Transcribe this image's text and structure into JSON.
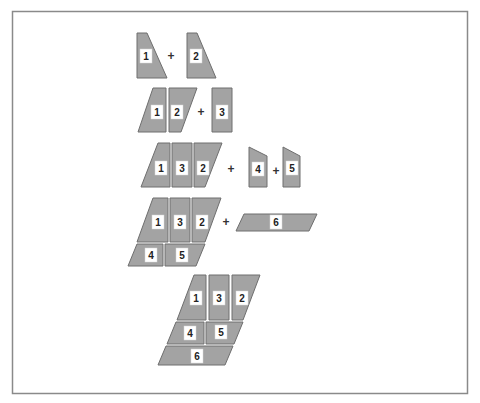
{
  "diagram": {
    "caption_cutoff": "",
    "colors": {
      "piece_fill": "#a3a3a3",
      "piece_stroke": "#6e6e6e",
      "label_bg": "#ffffff",
      "frame": "#8a8a8a"
    },
    "steps": [
      {
        "step": 1,
        "pieces": [
          {
            "label": "1",
            "points": "137,33 147,33 167,78 137,78",
            "lx": 146,
            "ly": 56
          },
          {
            "label": "2",
            "points": "187,33 197,33 216,78 187,78",
            "lx": 196,
            "ly": 56
          }
        ],
        "operators": [
          {
            "symbol": "+",
            "x": 171,
            "y": 56
          }
        ]
      },
      {
        "step": 2,
        "pieces": [
          {
            "label": "1",
            "points": "138,132 153,88 166,88 166,132",
            "lx": 157,
            "ly": 112
          },
          {
            "label": "2",
            "points": "169,88 197,88 181,132 169,132",
            "lx": 177,
            "ly": 112
          },
          {
            "label": "3",
            "points": "212,88 232,88 232,132 212,132",
            "lx": 222,
            "ly": 112
          }
        ],
        "operators": [
          {
            "symbol": "+",
            "x": 201,
            "y": 112
          }
        ]
      },
      {
        "step": 3,
        "pieces": [
          {
            "label": "1",
            "points": "141,187 158,143 170,143 170,187",
            "lx": 161,
            "ly": 168
          },
          {
            "label": "3",
            "points": "172,143 192,143 192,187 172,187",
            "lx": 182,
            "ly": 168
          },
          {
            "label": "2",
            "points": "194,143 222,143 205,187 194,187",
            "lx": 203,
            "ly": 168
          },
          {
            "label": "4",
            "points": "249,147 267,156 267,187 249,187",
            "lx": 258,
            "ly": 169
          },
          {
            "label": "5",
            "points": "283,147 300,156 300,187 283,187",
            "lx": 292,
            "ly": 168
          }
        ],
        "operators": [
          {
            "symbol": "+",
            "x": 231,
            "y": 169
          },
          {
            "symbol": "+",
            "x": 276,
            "y": 171
          }
        ]
      },
      {
        "step": 4,
        "pieces": [
          {
            "label": "1",
            "points": "137,242 153,198 168,198 168,242",
            "lx": 158,
            "ly": 222
          },
          {
            "label": "3",
            "points": "170,198 190,198 190,242 170,242",
            "lx": 180,
            "ly": 222
          },
          {
            "label": "2",
            "points": "192,198 221,198 205,242 192,242",
            "lx": 202,
            "ly": 222
          },
          {
            "label": "4",
            "points": "128,266 137,244 163,244 163,266",
            "lx": 151,
            "ly": 255
          },
          {
            "label": "5",
            "points": "165,244 205,244 196,266 165,266",
            "lx": 182,
            "ly": 255
          },
          {
            "label": "6",
            "points": "236,231 244,214 317,214 309,231",
            "lx": 276,
            "ly": 222
          }
        ],
        "operators": [
          {
            "symbol": "+",
            "x": 226,
            "y": 222
          }
        ]
      },
      {
        "step": 5,
        "pieces": [
          {
            "label": "1",
            "points": "177,320 194,275 206,275 206,320",
            "lx": 196,
            "ly": 298
          },
          {
            "label": "3",
            "points": "209,275 229,275 229,320 209,320",
            "lx": 219,
            "ly": 298
          },
          {
            "label": "2",
            "points": "232,275 260,275 243,320 232,320",
            "lx": 242,
            "ly": 298
          },
          {
            "label": "4",
            "points": "167,344 176,322 204,322 204,344",
            "lx": 190,
            "ly": 333
          },
          {
            "label": "5",
            "points": "206,322 243,322 234,344 206,344",
            "lx": 221,
            "ly": 332
          },
          {
            "label": "6",
            "points": "158,365 166,346 233,346 225,365",
            "lx": 197,
            "ly": 356
          }
        ],
        "operators": []
      }
    ]
  }
}
